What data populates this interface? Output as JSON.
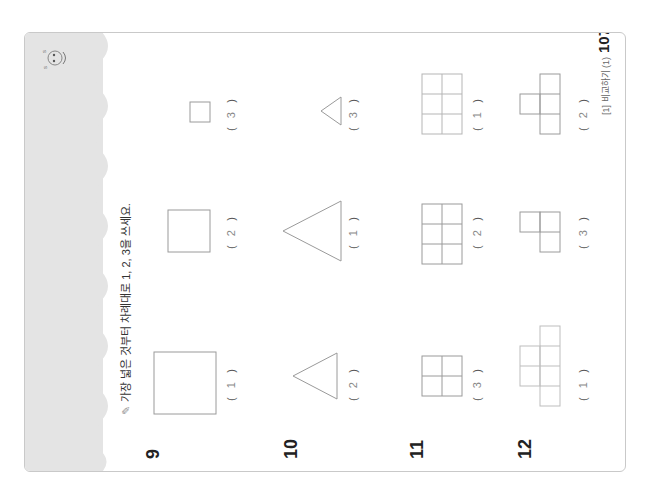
{
  "page": {
    "instruction": "가장 넓은 것부터 차례대로 1, 2, 3을 쓰세요.",
    "instruction_icon": "pencil-icon",
    "footer_label": "[1] 비교하기 (1)",
    "page_number": "107"
  },
  "problems": [
    {
      "number": "9",
      "shape": "square",
      "items": [
        {
          "answer": "1"
        },
        {
          "answer": "2"
        },
        {
          "answer": "3"
        }
      ]
    },
    {
      "number": "10",
      "shape": "triangle",
      "items": [
        {
          "answer": "2"
        },
        {
          "answer": "1"
        },
        {
          "answer": "3"
        }
      ]
    },
    {
      "number": "11",
      "shape": "grid",
      "items": [
        {
          "answer": "3"
        },
        {
          "answer": "2"
        },
        {
          "answer": "1"
        }
      ]
    },
    {
      "number": "12",
      "shape": "polyomino",
      "items": [
        {
          "answer": "1"
        },
        {
          "answer": "3"
        },
        {
          "answer": "2"
        }
      ]
    }
  ],
  "colors": {
    "band": "#e4e4e4",
    "shape_stroke": "#9a9a9a",
    "frame": "#c9c9c9"
  }
}
